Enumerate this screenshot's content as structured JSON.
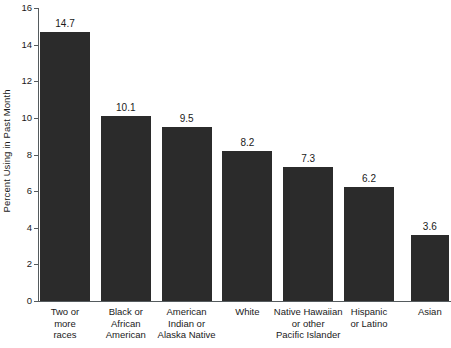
{
  "chart_data": {
    "type": "bar",
    "title": "",
    "xlabel": "",
    "ylabel": "Percent Using in Past Month",
    "ylim": [
      0,
      16
    ],
    "ytick_step": 2,
    "yticks": [
      16,
      14,
      12,
      10,
      8,
      6,
      4,
      2,
      0
    ],
    "grid": false,
    "legend": null,
    "bar_color": "#2b2b2b",
    "axis_color": "#555b5e",
    "background_color": "#ffffff",
    "categories": [
      "Two or\nmore\nraces",
      "Black or\nAfrican\nAmerican",
      "American\nIndian or\nAlaska Native",
      "White",
      "Native Hawaiian\nor other\nPacific Islander",
      "Hispanic\nor Latino",
      "Asian"
    ],
    "values": [
      14.7,
      10.1,
      9.5,
      8.2,
      7.3,
      6.2,
      3.6
    ],
    "value_labels": [
      "14.7",
      "10.1",
      "9.5",
      "8.2",
      "7.3",
      "6.2",
      "3.6"
    ],
    "tick_labels": [
      "16",
      "14",
      "12",
      "10",
      "8",
      "6",
      "4",
      "2",
      "0"
    ]
  }
}
